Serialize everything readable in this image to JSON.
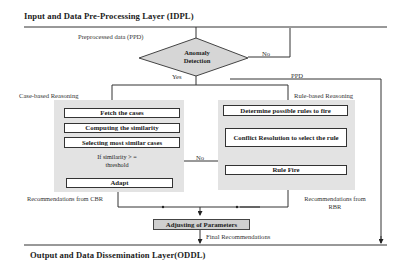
{
  "layers": {
    "input": "Input and Data Pre-Processing Layer (IDPL)",
    "output": "Output and Data Dissemination Layer(ODDL)"
  },
  "edges": {
    "preprocessed": "Preprocessed data (PPD)",
    "no_anomaly": "No",
    "yes_anomaly": "Yes",
    "ppd": "PPD",
    "no_threshold": "No",
    "yes_threshold": "Yes",
    "rule_found": "Rule found",
    "final": "Final Recommendations"
  },
  "decisions": {
    "anomaly": "Anomaly Detection",
    "threshold": "If similarity > = threshold"
  },
  "cbr": {
    "title": "Case-based Reasoning",
    "steps": [
      "Fetch the cases",
      "Computing the similarity",
      "Selecting most similar cases",
      "Adapt"
    ],
    "output": "Recommendations from CBR"
  },
  "rbr": {
    "title": "Rule-based Reasoning",
    "steps": [
      "Determine possible rules to fire",
      "Conflict Resolution to select the rule",
      "Rule Fire"
    ],
    "output": "Recommendations from RBR"
  },
  "merge": {
    "label": "Adjusting of Parameters"
  },
  "colors": {
    "panel": "#e3e3e3",
    "diamond": "#d6d6d6",
    "adjust": "#cfcfcf",
    "line": "#222222"
  }
}
